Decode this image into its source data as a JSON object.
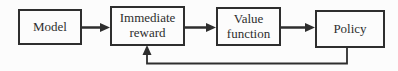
{
  "diagram": {
    "type": "flowchart",
    "nodes": [
      {
        "id": "model",
        "label": "Model"
      },
      {
        "id": "immediate-reward",
        "label": "Immediate reward"
      },
      {
        "id": "value-function",
        "label": "Value function"
      },
      {
        "id": "policy",
        "label": "Policy"
      }
    ],
    "edges": [
      {
        "from": "model",
        "to": "immediate-reward",
        "style": "straight-arrow"
      },
      {
        "from": "immediate-reward",
        "to": "value-function",
        "style": "straight-arrow"
      },
      {
        "from": "value-function",
        "to": "policy",
        "style": "straight-arrow"
      },
      {
        "from": "policy",
        "to": "immediate-reward",
        "style": "feedback-loop-arrow"
      }
    ],
    "colors": {
      "line": "#2e2e2e",
      "text": "#2e2e2e",
      "background": "#fcfcfc",
      "node_fill": "#fcfcfc"
    }
  }
}
